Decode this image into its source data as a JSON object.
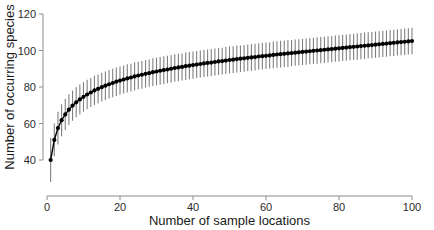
{
  "chart_data": {
    "type": "line",
    "title": "",
    "subtitle": "",
    "xlabel": "Number of sample locations",
    "ylabel": "Number of occurring species",
    "xlim": [
      0,
      100
    ],
    "ylim": [
      28,
      130
    ],
    "xticks": [
      0,
      20,
      40,
      60,
      80,
      100
    ],
    "yticks": [
      40,
      60,
      80,
      100,
      120
    ],
    "grid": false,
    "legend": null,
    "series": [
      {
        "name": "Species accumulation",
        "marker": "filled-circle",
        "marker_color": "#000000",
        "errorbar_color": "#808080",
        "x": [
          1,
          2,
          3,
          4,
          5,
          6,
          7,
          8,
          9,
          10,
          11,
          12,
          13,
          14,
          15,
          16,
          17,
          18,
          19,
          20,
          21,
          22,
          23,
          24,
          25,
          26,
          27,
          28,
          29,
          30,
          31,
          32,
          33,
          34,
          35,
          36,
          37,
          38,
          39,
          40,
          41,
          42,
          43,
          44,
          45,
          46,
          47,
          48,
          49,
          50,
          51,
          52,
          53,
          54,
          55,
          56,
          57,
          58,
          59,
          60,
          61,
          62,
          63,
          64,
          65,
          66,
          67,
          68,
          69,
          70,
          71,
          72,
          73,
          74,
          75,
          76,
          77,
          78,
          79,
          80,
          81,
          82,
          83,
          84,
          85,
          86,
          87,
          88,
          89,
          90,
          91,
          92,
          93,
          94,
          95,
          96,
          97,
          98,
          99,
          100
        ],
        "values": [
          40.0,
          51.0,
          57.5,
          61.8,
          65.0,
          67.6,
          69.8,
          71.6,
          73.2,
          74.6,
          75.9,
          77.0,
          78.1,
          79.0,
          79.9,
          80.7,
          81.5,
          82.2,
          82.9,
          83.5,
          84.1,
          84.7,
          85.2,
          85.8,
          86.3,
          86.7,
          87.2,
          87.6,
          88.1,
          88.5,
          88.9,
          89.3,
          89.6,
          90.0,
          90.4,
          90.7,
          91.0,
          91.4,
          91.7,
          92.0,
          92.3,
          92.6,
          92.9,
          93.2,
          93.4,
          93.7,
          94.0,
          94.2,
          94.5,
          94.8,
          95.0,
          95.3,
          95.5,
          95.7,
          96.0,
          96.2,
          96.4,
          96.7,
          96.9,
          97.1,
          97.3,
          97.6,
          97.8,
          98.0,
          98.2,
          98.4,
          98.6,
          98.8,
          99.0,
          99.2,
          99.4,
          99.6,
          99.8,
          100.0,
          100.2,
          100.4,
          100.6,
          100.8,
          101.0,
          101.2,
          101.4,
          101.6,
          101.8,
          102.0,
          102.2,
          102.4,
          102.6,
          102.8,
          103.0,
          103.2,
          103.4,
          103.6,
          103.8,
          104.0,
          104.2,
          104.4,
          104.6,
          104.8,
          105.0,
          105.2
        ],
        "err_low": [
          28.0,
          42.0,
          48.5,
          53.0,
          56.5,
          59.2,
          61.5,
          63.4,
          65.0,
          66.5,
          67.8,
          69.0,
          70.1,
          71.1,
          72.0,
          72.9,
          73.7,
          74.4,
          75.1,
          75.8,
          76.4,
          77.0,
          77.6,
          78.1,
          78.7,
          79.1,
          79.6,
          80.1,
          80.5,
          80.9,
          81.3,
          81.7,
          82.1,
          82.5,
          82.9,
          83.2,
          83.6,
          83.9,
          84.2,
          84.5,
          84.9,
          85.2,
          85.5,
          85.8,
          86.0,
          86.3,
          86.6,
          86.9,
          87.1,
          87.4,
          87.7,
          87.9,
          88.2,
          88.4,
          88.7,
          88.9,
          89.1,
          89.4,
          89.6,
          89.8,
          90.1,
          90.3,
          90.5,
          90.7,
          90.9,
          91.1,
          91.4,
          91.6,
          91.8,
          92.0,
          92.2,
          92.4,
          92.6,
          92.8,
          93.0,
          93.2,
          93.4,
          93.6,
          93.8,
          94.0,
          94.2,
          94.4,
          94.6,
          94.8,
          95.0,
          95.2,
          95.4,
          95.6,
          95.8,
          96.0,
          96.2,
          96.4,
          96.6,
          96.8,
          97.0,
          97.2,
          97.4,
          97.6,
          97.8,
          98.0
        ],
        "err_high": [
          52.0,
          60.0,
          66.5,
          70.6,
          73.5,
          76.0,
          78.1,
          79.8,
          81.4,
          82.7,
          84.0,
          85.0,
          86.1,
          86.9,
          87.8,
          88.5,
          89.3,
          90.0,
          90.7,
          91.2,
          91.8,
          92.4,
          92.8,
          93.5,
          93.9,
          94.3,
          94.8,
          95.1,
          95.7,
          96.1,
          96.5,
          96.9,
          97.1,
          97.5,
          97.9,
          98.2,
          98.4,
          98.9,
          99.2,
          99.5,
          99.7,
          100.0,
          100.3,
          100.6,
          100.8,
          101.1,
          101.4,
          101.5,
          101.9,
          102.2,
          102.3,
          102.7,
          102.8,
          103.0,
          103.3,
          103.5,
          103.7,
          104.0,
          104.2,
          104.4,
          104.5,
          104.9,
          105.1,
          105.3,
          105.5,
          105.7,
          105.8,
          106.0,
          106.2,
          106.4,
          106.6,
          106.8,
          107.0,
          107.2,
          107.4,
          107.6,
          107.8,
          108.0,
          108.2,
          108.4,
          108.6,
          108.8,
          109.0,
          109.2,
          109.4,
          109.6,
          109.8,
          110.0,
          110.2,
          110.4,
          110.6,
          110.8,
          111.0,
          111.2,
          111.4,
          111.6,
          111.8,
          112.0,
          112.2,
          112.4
        ]
      }
    ]
  },
  "axes": {
    "x_tick_labels": [
      "0",
      "20",
      "40",
      "60",
      "80",
      "100"
    ],
    "y_tick_labels": [
      "40",
      "60",
      "80",
      "100",
      "120"
    ],
    "x_title": "Number of sample locations",
    "y_title": "Number of occurring species"
  },
  "colors": {
    "marker": "#000000",
    "errorbar": "#808080",
    "axis": "#8c8c8c",
    "text": "#1a1a1a",
    "background": "#ffffff"
  }
}
